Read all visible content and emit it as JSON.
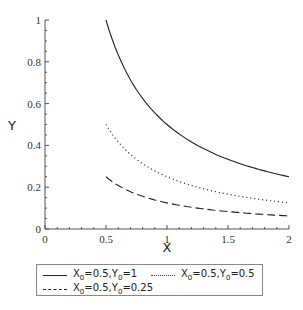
{
  "chart_data": {
    "type": "line",
    "title": "",
    "xlabel": "X",
    "ylabel": "Y",
    "xlim": [
      0,
      2
    ],
    "ylim": [
      0,
      1
    ],
    "x_ticks": [
      "0",
      "0.5",
      "1",
      "1.5",
      "2"
    ],
    "y_ticks": [
      "0",
      "0.2",
      "0.4",
      "0.6",
      "0.8",
      "1"
    ],
    "grid": false,
    "legend_position": "bottom",
    "series": [
      {
        "name": "X0=0.5,Y0=1",
        "style": "solid",
        "x": [
          0.5,
          0.75,
          1.0,
          1.25,
          1.5,
          1.75,
          2.0
        ],
        "values": [
          1.0,
          0.667,
          0.5,
          0.4,
          0.333,
          0.286,
          0.25
        ]
      },
      {
        "name": "X0=0.5,Y0=0.5",
        "style": "dotted",
        "x": [
          0.5,
          0.75,
          1.0,
          1.25,
          1.5,
          1.75,
          2.0
        ],
        "values": [
          0.5,
          0.333,
          0.25,
          0.2,
          0.167,
          0.143,
          0.125
        ]
      },
      {
        "name": "X0=0.5,Y0=0.25",
        "style": "dashed",
        "x": [
          0.5,
          0.75,
          1.0,
          1.25,
          1.5,
          1.75,
          2.0
        ],
        "values": [
          0.25,
          0.167,
          0.125,
          0.1,
          0.083,
          0.071,
          0.0625
        ]
      }
    ]
  },
  "legend": {
    "items": [
      {
        "x_sym": "X",
        "x_sub": "0",
        "x_val": "=0.5,",
        "y_sym": "Y",
        "y_sub": "0",
        "y_val": "=1"
      },
      {
        "x_sym": "X",
        "x_sub": "0",
        "x_val": "=0.5,",
        "y_sym": "Y",
        "y_sub": "0",
        "y_val": "=0.5"
      },
      {
        "x_sym": "X",
        "x_sub": "0",
        "x_val": "=0.5,",
        "y_sym": "Y",
        "y_sub": "0",
        "y_val": "=0.25"
      }
    ]
  }
}
